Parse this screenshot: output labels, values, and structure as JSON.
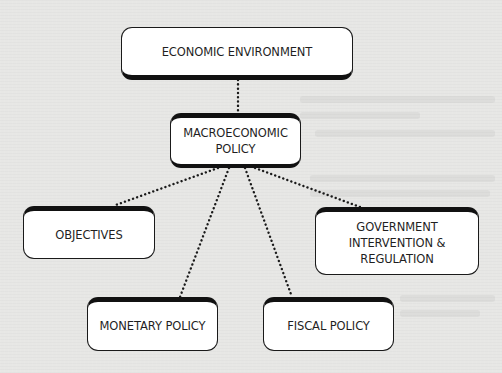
{
  "diagram": {
    "type": "hierarchy",
    "colors": {
      "background": "#e7e7e5",
      "box_fill": "#ffffff",
      "box_border": "#1a1a1a",
      "text": "#1f1f1f",
      "connector": "#1a1a1a"
    },
    "nodes": {
      "economic_environment": {
        "label": "ECONOMIC ENVIRONMENT"
      },
      "macroeconomic_policy": {
        "label": "MACROECONOMIC\nPOLICY"
      },
      "objectives": {
        "label": "OBJECTIVES"
      },
      "government_intervention": {
        "label": "GOVERNMENT\nINTERVENTION &\nREGULATION"
      },
      "monetary_policy": {
        "label": "MONETARY POLICY"
      },
      "fiscal_policy": {
        "label": "FISCAL POLICY"
      }
    },
    "edges": [
      {
        "from": "economic_environment",
        "to": "macroeconomic_policy",
        "style": "dotted"
      },
      {
        "from": "macroeconomic_policy",
        "to": "objectives",
        "style": "dotted"
      },
      {
        "from": "macroeconomic_policy",
        "to": "monetary_policy",
        "style": "dotted"
      },
      {
        "from": "macroeconomic_policy",
        "to": "fiscal_policy",
        "style": "dotted"
      },
      {
        "from": "macroeconomic_policy",
        "to": "government_intervention",
        "style": "dotted"
      }
    ]
  }
}
